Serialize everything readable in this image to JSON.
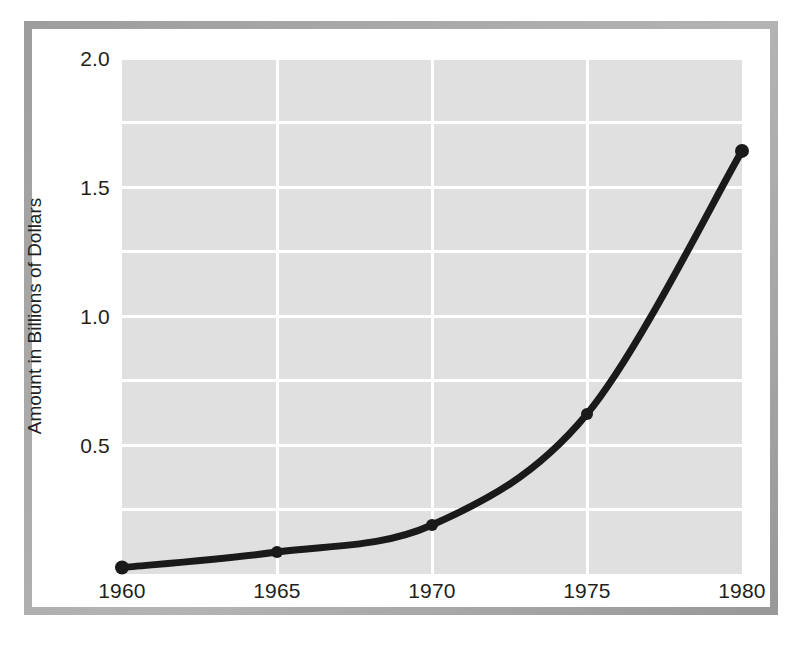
{
  "figure": {
    "frame_color": "#a8a8a8",
    "card_color": "#ffffff",
    "plot_background": "#e0e0e0",
    "gridline_color": "#ffffff",
    "series_color": "#1a1a1a"
  },
  "axes": {
    "y_title": "Amount in Billions of Dollars",
    "y_tick_labels": [
      "2.0",
      "1.5",
      "1.0",
      "0.5"
    ],
    "y_tick_values": [
      2.0,
      1.5,
      1.0,
      0.5
    ],
    "x_tick_labels": [
      "1960",
      "1965",
      "1970",
      "1975",
      "1980"
    ],
    "x_tick_values": [
      1960,
      1965,
      1970,
      1975,
      1980
    ]
  },
  "chart_data": {
    "type": "line",
    "title": "",
    "subtitle": "",
    "xlabel": "",
    "ylabel": "Amount in Billions of Dollars",
    "x": [
      1960,
      1965,
      1970,
      1975,
      1980
    ],
    "values": [
      0.025,
      0.085,
      0.19,
      0.62,
      1.64
    ],
    "series": [
      {
        "name": "Amount in Billions of Dollars",
        "values": [
          0.025,
          0.085,
          0.19,
          0.62,
          1.64
        ]
      }
    ],
    "categories": [
      "1960",
      "1965",
      "1970",
      "1975",
      "1980"
    ],
    "xlim": [
      1960,
      1980
    ],
    "ylim": [
      0.0,
      2.0
    ],
    "y_major_ticks": [
      0.5,
      1.0,
      1.5,
      2.0
    ],
    "y_minor_ticks": [
      0.25,
      0.75,
      1.25,
      1.75
    ],
    "x_gridlines": [
      1965,
      1970,
      1975
    ],
    "grid": true,
    "legend": false,
    "legend_position": "none",
    "markers": true,
    "marker_shape": "circle",
    "line_width_px": 7,
    "annotations": []
  }
}
